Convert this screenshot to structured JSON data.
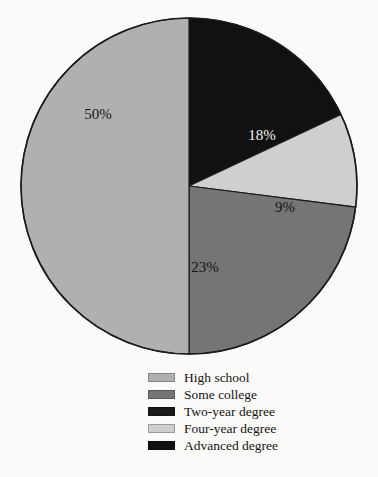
{
  "chart_data": {
    "type": "pie",
    "title": "",
    "subtitle": "",
    "xlabel": "",
    "ylabel": "",
    "grid": false,
    "legend_position": "bottom",
    "start_angle_deg": 0,
    "direction": "clockwise",
    "center": {
      "cx": 189,
      "cy": 186,
      "r": 168
    },
    "categories": [
      "High school",
      "Some college",
      "Two-year degree",
      "Four-year degree",
      "Advanced degree"
    ],
    "values": [
      50,
      23,
      0,
      9,
      18
    ],
    "data_labels": [
      "50%",
      "23%",
      "",
      "9%",
      "18%"
    ],
    "colors": [
      "#b0b0b0",
      "#757575",
      "#1a1a1a",
      "#cfcfcf",
      "#111111"
    ],
    "slices": [
      {
        "label": "Advanced degree",
        "value": 18,
        "data_label": "18%",
        "color": "#111111",
        "label_color": "#f2f2f2",
        "start_deg": 0,
        "end_deg": 64.8,
        "label_x": 262,
        "label_y": 140
      },
      {
        "label": "Four-year degree",
        "value": 9,
        "data_label": "9%",
        "color": "#cfcfcf",
        "label_color": "#161412",
        "start_deg": 64.8,
        "end_deg": 97.2,
        "label_x": 285,
        "label_y": 212
      },
      {
        "label": "Some college",
        "value": 23,
        "data_label": "23%",
        "color": "#757575",
        "label_color": "#161412",
        "start_deg": 97.2,
        "end_deg": 180.0,
        "label_x": 205,
        "label_y": 272
      },
      {
        "label": "High school",
        "value": 50,
        "data_label": "50%",
        "color": "#b0b0b0",
        "label_color": "#161412",
        "start_deg": 180.0,
        "end_deg": 360.0,
        "label_x": 98,
        "label_y": 119
      }
    ],
    "outline_color": "#1d1b19"
  },
  "legend": {
    "items": [
      {
        "label": "High school",
        "color": "#b0b0b0"
      },
      {
        "label": "Some college",
        "color": "#757575"
      },
      {
        "label": "Two-year degree",
        "color": "#1a1a1a"
      },
      {
        "label": "Four-year degree",
        "color": "#cfcfcf"
      },
      {
        "label": "Advanced degree",
        "color": "#111111"
      }
    ]
  }
}
